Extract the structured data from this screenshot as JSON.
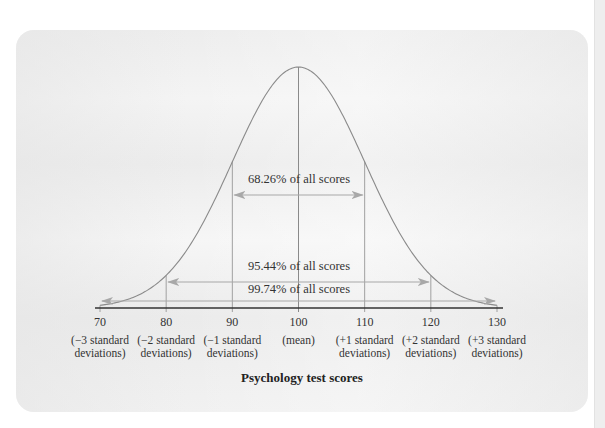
{
  "chart_data": {
    "type": "line",
    "title": "",
    "xlabel": "Psychology test scores",
    "ylabel": "",
    "curve": "normal distribution (bell curve)",
    "mean": 100,
    "std_dev": 10,
    "xlim": [
      70,
      130
    ],
    "ticks": [
      {
        "value": "70",
        "label": "(−3 standard deviations)"
      },
      {
        "value": "80",
        "label": "(−2 standard deviations)"
      },
      {
        "value": "90",
        "label": "(−1 standard deviations)"
      },
      {
        "value": "100",
        "label": "(mean)"
      },
      {
        "value": "110",
        "label": "(+1 standard deviations)"
      },
      {
        "value": "120",
        "label": "(+2 standard deviations)"
      },
      {
        "value": "130",
        "label": "(+3 standard deviations)"
      }
    ],
    "annotations": [
      {
        "text": "68.26% of all scores",
        "range": [
          90,
          110
        ]
      },
      {
        "text": "95.44% of all scores",
        "range": [
          80,
          120
        ]
      },
      {
        "text": "99.74% of all scores",
        "range": [
          70,
          130
        ]
      }
    ],
    "grid": false,
    "legend": "none"
  },
  "colors": {
    "curve": "#8a8a8a",
    "axis": "#333333",
    "arrow": "#a8a8a8",
    "guide": "#9a9a9a",
    "card": "#efefef"
  }
}
